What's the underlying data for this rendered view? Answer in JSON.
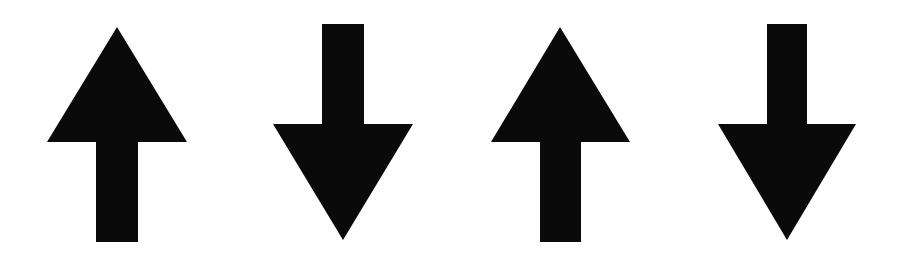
{
  "figure": {
    "background": "#ffffff",
    "arrow_color": "#0a0a0a",
    "arrows": [
      {
        "direction": "up",
        "icon": "arrow-up-icon",
        "x": 47,
        "width": 140
      },
      {
        "direction": "down",
        "icon": "arrow-down-icon",
        "x": 273,
        "width": 140
      },
      {
        "direction": "up",
        "icon": "arrow-up-icon",
        "x": 491,
        "width": 140
      },
      {
        "direction": "down",
        "icon": "arrow-down-icon",
        "x": 718,
        "width": 139
      }
    ]
  }
}
